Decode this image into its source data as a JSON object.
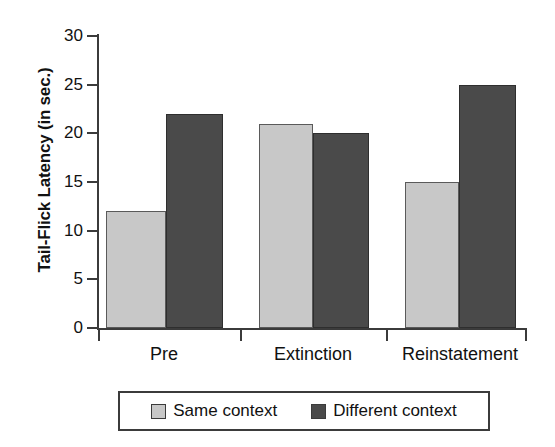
{
  "chart_data": {
    "type": "bar",
    "title": "",
    "xlabel": "",
    "ylabel": "Tail-Flick Latency (in sec.)",
    "categories": [
      "Pre",
      "Extinction",
      "Reinstatement"
    ],
    "series": [
      {
        "name": "Same context",
        "color": "#c8c8c8",
        "values": [
          12,
          21,
          15
        ]
      },
      {
        "name": "Different context",
        "color": "#4a4a4a",
        "values": [
          22,
          20,
          25
        ]
      }
    ],
    "ylim": [
      0,
      30
    ],
    "ytick_labels": [
      "0",
      "5",
      "10",
      "15",
      "20",
      "25",
      "30"
    ],
    "ytick_values": [
      0,
      5,
      10,
      15,
      20,
      25,
      30
    ],
    "grid": false,
    "legend_position": "bottom"
  },
  "axis": {
    "y_title": "Tail-Flick Latency (in sec.)"
  },
  "legend": {
    "items": [
      {
        "label": "Same context",
        "swatch": "light-gray-swatch"
      },
      {
        "label": "Different context",
        "swatch": "dark-gray-swatch"
      }
    ]
  }
}
